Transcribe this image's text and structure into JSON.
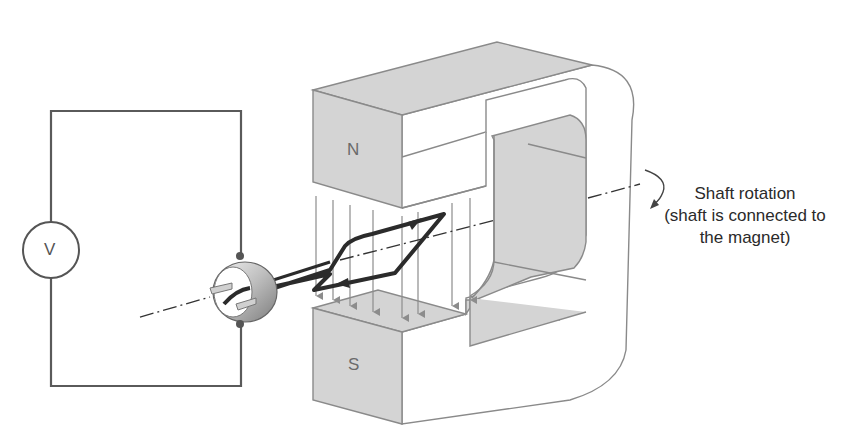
{
  "diagram": {
    "labels": {
      "north_pole": "N",
      "south_pole": "S",
      "voltmeter": "V"
    },
    "caption": {
      "line1": "Shaft rotation",
      "line2": "(shaft is connected to",
      "line3": "the magnet)"
    },
    "colors": {
      "magnet_fill": "#d4d4d4",
      "magnet_stroke": "#8a8a8a",
      "circuit_wire": "#5a5a5a",
      "coil": "#2b2b2b",
      "field_lines": "#8c8c8c",
      "background": "#ffffff"
    },
    "components": [
      "voltmeter",
      "circuit-wire",
      "slip-rings",
      "coil",
      "horseshoe-magnet",
      "field-lines",
      "shaft-axis",
      "rotation-arrow"
    ]
  }
}
